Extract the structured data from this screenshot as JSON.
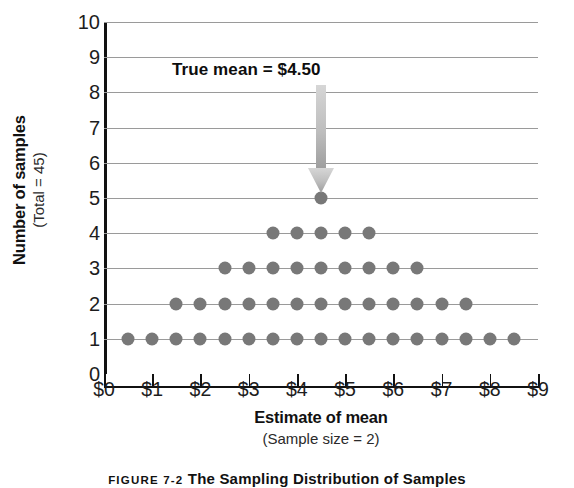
{
  "chart_data": {
    "type": "scatter",
    "title": "",
    "xlabel": "Estimate of mean",
    "xlabel_sub": "(Sample size = 2)",
    "ylabel": "Number of samples",
    "ylabel_sub": "(Total = 45)",
    "xlim": [
      0,
      9
    ],
    "ylim": [
      0,
      10
    ],
    "grid": true,
    "legend": "none",
    "xtick_labels": [
      "$0",
      "$1",
      "$2",
      "$3",
      "$4",
      "$5",
      "$6",
      "$7",
      "$8",
      "$9"
    ],
    "xtick_values": [
      0,
      1,
      2,
      3,
      4,
      5,
      6,
      7,
      8,
      9
    ],
    "ytick_labels": [
      "0",
      "1",
      "2",
      "3",
      "4",
      "5",
      "6",
      "7",
      "8",
      "9",
      "10"
    ],
    "ytick_values": [
      0,
      1,
      2,
      3,
      4,
      5,
      6,
      7,
      8,
      9,
      10
    ],
    "dot_color": "#787878",
    "gridline_color": "#9a9a9a",
    "axis_color": "#111111",
    "total_points": 45,
    "rows": [
      {
        "y": 1,
        "count": 17,
        "x": [
          0.5,
          1.0,
          1.5,
          2.0,
          2.5,
          3.0,
          3.5,
          4.0,
          4.5,
          5.0,
          5.5,
          6.0,
          6.5,
          7.0,
          7.5,
          8.0,
          8.5
        ]
      },
      {
        "y": 2,
        "count": 13,
        "x": [
          1.5,
          2.0,
          2.5,
          3.0,
          3.5,
          4.0,
          4.5,
          5.0,
          5.5,
          6.0,
          6.5,
          7.0,
          7.5
        ]
      },
      {
        "y": 3,
        "count": 9,
        "x": [
          2.5,
          3.0,
          3.5,
          4.0,
          4.5,
          5.0,
          5.5,
          6.0,
          6.5
        ]
      },
      {
        "y": 4,
        "count": 5,
        "x": [
          3.5,
          4.0,
          4.5,
          5.0,
          5.5
        ]
      },
      {
        "y": 5,
        "count": 1,
        "x": [
          4.5
        ]
      }
    ],
    "distribution_by_x": {
      "0.5": 1,
      "1.0": 1,
      "1.5": 2,
      "2.0": 2,
      "2.5": 3,
      "3.0": 3,
      "3.5": 4,
      "4.0": 4,
      "4.5": 5,
      "5.0": 4,
      "5.5": 4,
      "6.0": 3,
      "6.5": 3,
      "7.0": 2,
      "7.5": 2,
      "8.0": 1,
      "8.5": 1
    },
    "annotations": [
      {
        "text": "True mean  =  $4.50",
        "value": 4.5,
        "arrow": "down",
        "arrow_color_top": "#cfcfcf",
        "arrow_color_bottom": "#9e9e9e"
      }
    ]
  },
  "annotation": {
    "label": "True mean  =  $4.50"
  },
  "caption": {
    "number": "FIGURE 7-2",
    "text": "The Sampling Distribution of Samples"
  }
}
